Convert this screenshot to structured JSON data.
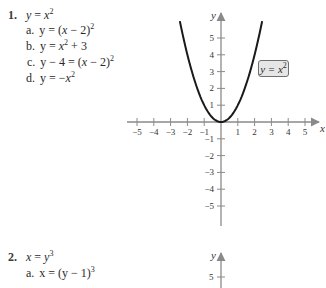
{
  "problems": [
    {
      "number": "1.",
      "base_equation": {
        "lhs": "y",
        "rhs_var": "x",
        "rhs_exp": "2"
      },
      "items": [
        {
          "label": "a.",
          "text_parts": [
            "y = (",
            "x",
            " − 2)"
          ],
          "exp": "2"
        },
        {
          "label": "b.",
          "text_parts": [
            "y = ",
            "x",
            ""
          ],
          "exp": "2",
          "suffix": " + 3"
        },
        {
          "label": "c.",
          "text_parts": [
            "y − 4 = (",
            "x",
            " − 2)"
          ],
          "exp": "2"
        },
        {
          "label": "d.",
          "text_parts": [
            "y = −",
            "x",
            ""
          ],
          "exp": "2"
        }
      ]
    },
    {
      "number": "2.",
      "base_equation": {
        "lhs": "x",
        "rhs_var": "y",
        "rhs_exp": "3"
      },
      "items": [
        {
          "label": "a.",
          "text_parts": [
            "x = (y − 1)"
          ],
          "exp": "3"
        }
      ]
    }
  ],
  "chart_data": [
    {
      "type": "line",
      "title": "",
      "function": "y = x^2",
      "annotation": "y = x²",
      "xlabel": "x",
      "ylabel": "y",
      "xlim": [
        -5.5,
        5.5
      ],
      "ylim": [
        -5.5,
        6
      ],
      "x_ticks": [
        -5,
        -4,
        -3,
        -2,
        -1,
        1,
        2,
        3,
        4,
        5
      ],
      "y_ticks": [
        -5,
        -4,
        -3,
        -2,
        -1,
        1,
        2,
        3,
        4,
        5
      ],
      "grid": false,
      "x": [
        -2.45,
        -2,
        -1.5,
        -1,
        -0.5,
        0,
        0.5,
        1,
        1.5,
        2,
        2.45
      ],
      "y": [
        6.0,
        4,
        2.25,
        1,
        0.25,
        0,
        0.25,
        1,
        2.25,
        4,
        6.0
      ]
    },
    {
      "type": "line",
      "title": "",
      "function": "x = y^3",
      "ylabel": "y",
      "y_ticks_visible": [
        5
      ],
      "note": "partially visible (cropped at bottom)"
    }
  ],
  "axis1": {
    "x_tick_labels": [
      "−5",
      "−4",
      "−3",
      "−2",
      "−1",
      "1",
      "2",
      "3",
      "4",
      "5"
    ],
    "y_tick_labels_pos": [
      "1",
      "2",
      "3",
      "4",
      "5"
    ],
    "y_tick_labels_neg": [
      "−1",
      "−2",
      "−3",
      "−4",
      "−5"
    ],
    "x_axis_label": "x",
    "y_axis_label": "y",
    "curve_label_lhs": "y = ",
    "curve_label_var": "x",
    "curve_label_exp": "2"
  },
  "axis2": {
    "y_axis_label": "y",
    "y_tick_label": "5"
  },
  "colors": {
    "axis": "#8a8a8a",
    "curve": "#1a1a1a",
    "label_fill": "#e6e6e6",
    "label_border": "#6f6f6f"
  }
}
